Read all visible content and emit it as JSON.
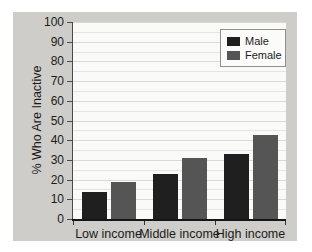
{
  "figure": {
    "page_background": "#ffffff",
    "panel_background": "#cecdc9",
    "plot_background": "#fafaf8",
    "gridline_color": "#e4e4e1",
    "axis_color": "#161616",
    "text_color": "#1b1b1b"
  },
  "chart_data": {
    "type": "bar",
    "title": "",
    "xlabel": "",
    "ylabel": "% Who Are Inactive",
    "categories": [
      "Low income",
      "Middle income",
      "High income"
    ],
    "series": [
      {
        "name": "Male",
        "color": "#1f1f1f",
        "values": [
          13.5,
          23,
          33
        ]
      },
      {
        "name": "Female",
        "color": "#555555",
        "values": [
          19,
          31,
          42.5
        ]
      }
    ],
    "ylim": [
      0,
      100
    ],
    "yticks": [
      0,
      10,
      20,
      30,
      40,
      50,
      60,
      70,
      80,
      90,
      100
    ],
    "minor_grid_step": 5,
    "grid": "horizontal",
    "legend_position": "top-right",
    "bar_width_px": 25,
    "bar_gap_px": 4
  }
}
